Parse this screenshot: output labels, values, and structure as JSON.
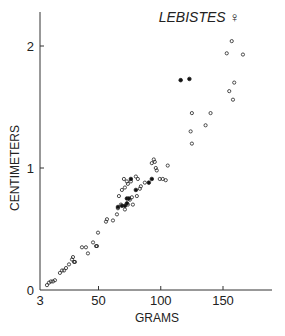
{
  "chart_data": {
    "type": "scatter",
    "title": "LEBISTES ♀",
    "xlabel": "GRAMS",
    "ylabel": "CENTIMETERS",
    "xlim": [
      3,
      190
    ],
    "ylim": [
      0,
      2.3
    ],
    "x_ticks": [
      3,
      50,
      100,
      150
    ],
    "x_tick_labels": [
      "3",
      "50",
      "100",
      "150"
    ],
    "y_ticks": [
      0,
      1,
      2
    ],
    "y_tick_labels": [
      "0",
      "1",
      "2"
    ],
    "grid": false,
    "series": [
      {
        "name": "open",
        "marker": "open-circle",
        "points": [
          [
            8.6,
            0.04
          ],
          [
            10.2,
            0.06
          ],
          [
            11.8,
            0.07
          ],
          [
            13.4,
            0.07
          ],
          [
            15,
            0.08
          ],
          [
            19,
            0.14
          ],
          [
            20.7,
            0.16
          ],
          [
            22.3,
            0.16
          ],
          [
            23.9,
            0.18
          ],
          [
            26.3,
            0.21
          ],
          [
            28.7,
            0.25
          ],
          [
            29.5,
            0.27
          ],
          [
            30.3,
            0.23
          ],
          [
            31.1,
            0.23
          ],
          [
            36.7,
            0.35
          ],
          [
            39.9,
            0.35
          ],
          [
            41.5,
            0.3
          ],
          [
            45.6,
            0.39
          ],
          [
            48,
            0.36
          ],
          [
            48.8,
            0.36
          ],
          [
            49.6,
            0.47
          ],
          [
            56,
            0.56
          ],
          [
            56.8,
            0.58
          ],
          [
            61.6,
            0.57
          ],
          [
            64.8,
            0.62
          ],
          [
            65.6,
            0.67
          ],
          [
            68,
            0.7
          ],
          [
            71.2,
            0.66
          ],
          [
            73.6,
            0.7
          ],
          [
            75.2,
            0.74
          ],
          [
            76.8,
            0.76
          ],
          [
            77.6,
            0.7
          ],
          [
            80.8,
            0.77
          ],
          [
            83.2,
            0.83
          ],
          [
            84,
            0.85
          ],
          [
            87.2,
            0.88
          ],
          [
            92.8,
            1.04
          ],
          [
            94.4,
            1.07
          ],
          [
            96.8,
            0.98
          ],
          [
            104,
            0.9
          ],
          [
            99.2,
            0.91
          ],
          [
            101.6,
            0.91
          ],
          [
            105.6,
            1.02
          ],
          [
            96,
            1.0
          ],
          [
            95.2,
            1.05
          ],
          [
            80,
            0.93
          ],
          [
            81.6,
            0.91
          ],
          [
            76,
            0.89
          ],
          [
            73.6,
            0.87
          ],
          [
            71.2,
            0.84
          ],
          [
            68.8,
            0.82
          ],
          [
            66.4,
            0.77
          ],
          [
            70.4,
            0.91
          ],
          [
            72.8,
            0.89
          ],
          [
            125,
            1.2
          ],
          [
            124,
            1.3
          ],
          [
            136,
            1.35
          ],
          [
            125,
            1.45
          ],
          [
            140,
            1.45
          ],
          [
            155,
            1.63
          ],
          [
            158,
            1.56
          ],
          [
            159,
            1.7
          ],
          [
            153,
            1.94
          ],
          [
            157,
            2.04
          ],
          [
            166,
            1.93
          ]
        ]
      },
      {
        "name": "filled",
        "marker": "filled-circle",
        "points": [
          [
            65.6,
            0.68
          ],
          [
            68.8,
            0.69
          ],
          [
            71.2,
            0.69
          ],
          [
            72.8,
            0.71
          ],
          [
            72.8,
            0.75
          ],
          [
            74.4,
            0.75
          ],
          [
            80,
            0.82
          ],
          [
            76,
            0.91
          ],
          [
            90.4,
            0.88
          ],
          [
            92.8,
            0.91
          ],
          [
            116,
            1.72
          ],
          [
            123,
            1.73
          ]
        ]
      }
    ]
  }
}
